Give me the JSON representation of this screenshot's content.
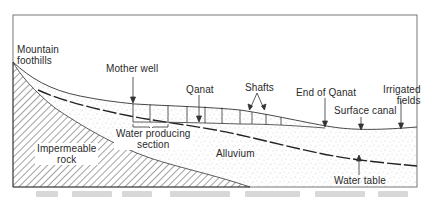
{
  "diagram": {
    "title_caption_visible": false,
    "labels": {
      "mountain_foothills": [
        "Mountain",
        "foothills"
      ],
      "mother_well": "Mother well",
      "qanat": "Qanat",
      "shafts": "Shafts",
      "end_of_qanat": "End of Qanat",
      "irrigated_fields": [
        "Irrigated",
        "fields"
      ],
      "surface_canal": "Surface canal",
      "water_producing_section": [
        "Water producing",
        "section"
      ],
      "impermeable_rock": [
        "Impermeable",
        "rock"
      ],
      "alluvium": "Alluvium",
      "water_table": "Water table"
    },
    "layers": [
      "Impermeable rock",
      "Alluvium",
      "Water table",
      "Ground surface",
      "Qanat tunnel",
      "Shafts"
    ],
    "colors": {
      "line": "#333333",
      "background": "#ffffff",
      "stipple": "#9a9a9a",
      "hatch": "#444444"
    }
  }
}
